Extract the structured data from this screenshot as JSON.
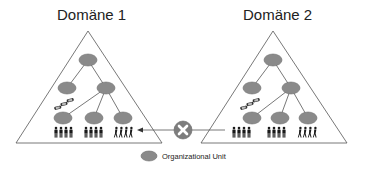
{
  "domains": [
    {
      "title": "Domäne 1",
      "apex": [
        88,
        31
      ],
      "base_left": [
        16,
        143
      ],
      "base_right": [
        162,
        143
      ],
      "nodes": {
        "root": [
          88,
          60
        ],
        "level2": [
          [
            67,
            88
          ],
          [
            106,
            88
          ]
        ],
        "level3": [
          [
            63,
            118
          ],
          [
            94,
            118
          ],
          [
            123,
            118
          ]
        ]
      },
      "cars": [
        64,
        103
      ],
      "people_y": 134
    },
    {
      "title": "Domäne 2",
      "apex": [
        273,
        31
      ],
      "base_left": [
        201,
        143
      ],
      "base_right": [
        347,
        143
      ],
      "nodes": {
        "root": [
          273,
          60
        ],
        "level2": [
          [
            252,
            88
          ],
          [
            291,
            88
          ]
        ],
        "level3": [
          [
            252,
            118
          ],
          [
            280,
            118
          ],
          [
            308,
            118
          ]
        ]
      },
      "cars": [
        249,
        103
      ],
      "people_y": 134
    }
  ],
  "blocked_connection": {
    "icon": "x-circle-icon",
    "center": [
      183,
      130
    ],
    "arrow_direction": "toward-domain-1"
  },
  "legend": {
    "icon": "gray-ellipse",
    "label": "Organizational Unit"
  },
  "colors": {
    "node_fill": "#8a8a8a",
    "node_stroke": "#6f6f6f",
    "line": "#555555",
    "x_circle": "#7d7d7d",
    "people": "#1a1a1a"
  }
}
